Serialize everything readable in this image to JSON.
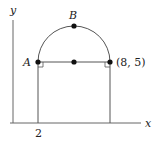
{
  "diagram": {
    "axes": {
      "x_label": "x",
      "y_label": "y"
    },
    "tick_label_x": "2",
    "point_a_label": "A",
    "point_b_label": "B",
    "right_point_label": "(8, 5)",
    "colors": {
      "stroke": "#555555",
      "point": "#111111",
      "text": "#222222"
    }
  }
}
